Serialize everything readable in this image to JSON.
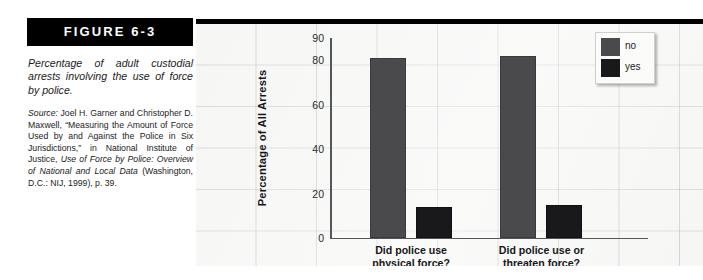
{
  "figure": {
    "header_label": "FIGURE 6-3",
    "caption_title": "Percentage of adult custodial arrests involving the use of force by police.",
    "source_lead": "Source:",
    "source_body_1": " Joel H. Garner and Christopher D. Maxwell, “Measuring the Amount of Force Used by and Against the Police in Six Jurisdictions,” in National Institute of Justice, ",
    "source_italic_1": "Use of Force by Police: Overview of National and Local Data",
    "source_body_2": " (Washington, D.C.: NIJ, 1999), p. 39."
  },
  "chart_data": {
    "type": "bar",
    "title": "",
    "subtitle": "",
    "xlabel": "",
    "ylabel": "Percentage of All Arrests",
    "ylim": [
      0,
      90
    ],
    "ytick_values": [
      0,
      20,
      40,
      60,
      80,
      90
    ],
    "ytick_labels": [
      "0",
      "20",
      "40",
      "60",
      "80",
      "90"
    ],
    "grid": true,
    "legend_position": "top-right",
    "categories": [
      "Did police use physical force?",
      "Did police use or threaten force?"
    ],
    "category_lines": [
      [
        "Did police use",
        "physical force?"
      ],
      [
        "Did police use or",
        "threaten force?"
      ]
    ],
    "series": [
      {
        "name": "no",
        "color": "#4a4a4c",
        "values": [
          81,
          82
        ]
      },
      {
        "name": "yes",
        "color": "#19191b",
        "values": [
          14,
          15
        ]
      }
    ],
    "legend_entries": [
      {
        "label": "no",
        "color": "#4a4a4c"
      },
      {
        "label": "yes",
        "color": "#19191b"
      }
    ],
    "colors": {
      "panel_background": "#f2f2f0",
      "gridline": "#96989c",
      "axis": "#55565a",
      "header_bar": "#000000",
      "page_background": "#ffffff"
    }
  }
}
